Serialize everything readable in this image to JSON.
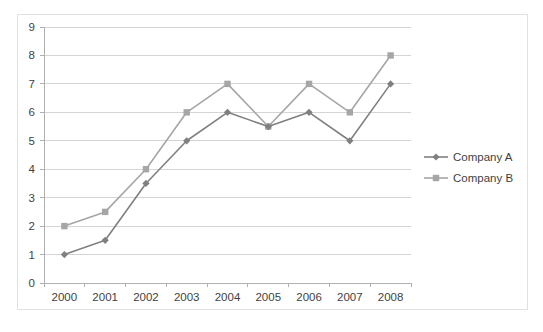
{
  "chart_data": {
    "type": "line",
    "title": "",
    "subtitle": "",
    "xlabel": "",
    "ylabel": "",
    "categories": [
      "2000",
      "2001",
      "2002",
      "2003",
      "2004",
      "2005",
      "2006",
      "2007",
      "2008"
    ],
    "series": [
      {
        "name": "Company A",
        "color": "#808080",
        "marker": "diamond",
        "values": [
          1,
          1.5,
          3.5,
          5,
          6,
          5.5,
          6,
          5,
          7
        ]
      },
      {
        "name": "Company B",
        "color": "#a6a6a6",
        "marker": "square",
        "values": [
          2,
          2.5,
          4,
          6,
          7,
          5.5,
          7,
          6,
          8
        ]
      }
    ],
    "ylim": [
      0,
      9
    ],
    "ytick_values": [
      0,
      1,
      2,
      3,
      4,
      5,
      6,
      7,
      8,
      9
    ],
    "ytick_labels": [
      "0",
      "1",
      "2",
      "3",
      "4",
      "5",
      "6",
      "7",
      "8",
      "9"
    ],
    "grid": true,
    "grid_axis": "y",
    "legend_position": "right",
    "legend_entries": [
      "Company A",
      "Company B"
    ],
    "border_color": "#e2e2e2",
    "gridline_color": "#d4d4d4",
    "axis_color": "#b0b0b0",
    "background": "#ffffff"
  }
}
